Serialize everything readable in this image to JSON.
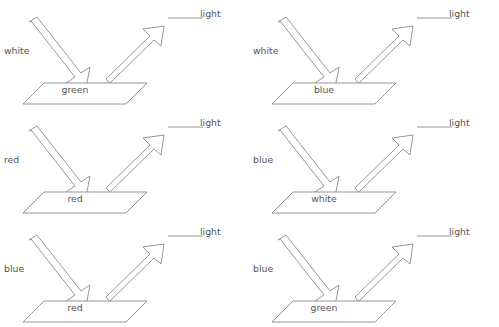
{
  "diagram": {
    "type": "physics-light-reflection-worksheet",
    "background_color": "#ffffff",
    "stroke_color": "#8a8a8a",
    "text_color": "#555555",
    "columns": 2,
    "rows": 3,
    "answer_label": "light",
    "answer_blank": "",
    "panels": [
      {
        "id": "panel-1",
        "incoming_light_label": "white",
        "surface_label": "green",
        "reflected_light_label": "light",
        "reflected_light_blank": ""
      },
      {
        "id": "panel-2",
        "incoming_light_label": "white",
        "surface_label": "blue",
        "reflected_light_label": "light",
        "reflected_light_blank": ""
      },
      {
        "id": "panel-3",
        "incoming_light_label": "red",
        "surface_label": "red",
        "reflected_light_label": "light",
        "reflected_light_blank": ""
      },
      {
        "id": "panel-4",
        "incoming_light_label": "blue",
        "surface_label": "white",
        "reflected_light_label": "light",
        "reflected_light_blank": ""
      },
      {
        "id": "panel-5",
        "incoming_light_label": "blue",
        "surface_label": "red",
        "reflected_light_label": "light",
        "reflected_light_blank": ""
      },
      {
        "id": "panel-6",
        "incoming_light_label": "blue",
        "surface_label": "green",
        "reflected_light_label": "light",
        "reflected_light_blank": ""
      }
    ]
  }
}
